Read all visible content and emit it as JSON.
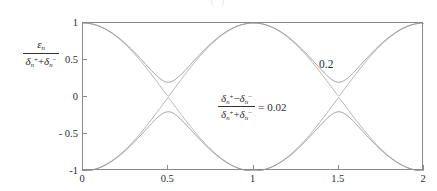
{
  "figure": {
    "caption_remnant": "( )",
    "y_axis_label": {
      "numerator_symbol": "ε",
      "numerator_sub": "n",
      "den_first_symbol": "δ",
      "den_first_sub": "n",
      "den_first_sup": "+",
      "den_plus": "+",
      "den_second_symbol": "δ",
      "den_second_sub": "n",
      "den_second_sup": "−"
    },
    "annotation_ratio": {
      "num_first_symbol": "δ",
      "num_first_sub": "n",
      "num_first_sup": "+",
      "num_minus": "−",
      "num_second_symbol": "δ",
      "num_second_sub": "n",
      "num_second_sup": "−",
      "den_first_symbol": "δ",
      "den_first_sub": "n",
      "den_first_sup": "+",
      "den_plus": "+",
      "den_second_symbol": "δ",
      "den_second_sub": "n",
      "den_second_sup": "−",
      "equals": "=",
      "value": "0.02"
    },
    "annotation_gap_label": "0.2",
    "colors": {
      "axis": "#8a8a8a",
      "curve_small_gap": "#9a9a9a",
      "curve_large_gap": "#8c8c8c",
      "text": "#2b2b2b"
    }
  },
  "chart_data": {
    "type": "line",
    "title": "",
    "xlabel": "",
    "ylabel": "ε_n / (δ_n^+ + δ_n^-)",
    "xlim": [
      0,
      2
    ],
    "ylim": [
      -1,
      1
    ],
    "xticks": [
      0,
      0.5,
      1,
      1.5,
      2
    ],
    "xticklabels": [
      "0",
      "0.5",
      "1",
      "1.5",
      "2"
    ],
    "yticks": [
      1,
      0.5,
      0,
      -0.5,
      -1
    ],
    "yticklabels": [
      "1",
      "0.5",
      "0",
      "- 0.5",
      "-1"
    ],
    "grid": false,
    "legend": null,
    "annotations": [
      {
        "text": "0.2",
        "x": 1.55,
        "y": 0.36
      },
      {
        "text": "(δ_n^+ − δ_n^-)/(δ_n^+ + δ_n^-) = 0.02",
        "x": 0.92,
        "y": 0.05
      }
    ],
    "series": [
      {
        "name": "gap 0.02 upper",
        "gap_half_width": 0.01,
        "x": [
          0,
          0.05,
          0.1,
          0.15,
          0.2,
          0.25,
          0.3,
          0.35,
          0.4,
          0.45,
          0.5,
          0.55,
          0.6,
          0.65,
          0.7,
          0.75,
          0.8,
          0.85,
          0.9,
          0.95,
          1,
          1.05,
          1.1,
          1.15,
          1.2,
          1.25,
          1.3,
          1.35,
          1.4,
          1.45,
          1.5,
          1.55,
          1.6,
          1.65,
          1.7,
          1.75,
          1.8,
          1.85,
          1.9,
          1.95,
          2
        ],
        "values": [
          1,
          0.988,
          0.951,
          0.891,
          0.809,
          0.707,
          0.588,
          0.454,
          0.309,
          0.157,
          0.01,
          0.157,
          0.309,
          0.454,
          0.588,
          0.707,
          0.809,
          0.891,
          0.951,
          0.988,
          1,
          0.988,
          0.951,
          0.891,
          0.809,
          0.707,
          0.588,
          0.454,
          0.309,
          0.157,
          0.01,
          0.157,
          0.309,
          0.454,
          0.588,
          0.707,
          0.809,
          0.891,
          0.951,
          0.988,
          1
        ]
      },
      {
        "name": "gap 0.02 lower",
        "gap_half_width": 0.01,
        "x": [
          0,
          0.05,
          0.1,
          0.15,
          0.2,
          0.25,
          0.3,
          0.35,
          0.4,
          0.45,
          0.5,
          0.55,
          0.6,
          0.65,
          0.7,
          0.75,
          0.8,
          0.85,
          0.9,
          0.95,
          1,
          1.05,
          1.1,
          1.15,
          1.2,
          1.25,
          1.3,
          1.35,
          1.4,
          1.45,
          1.5,
          1.55,
          1.6,
          1.65,
          1.7,
          1.75,
          1.8,
          1.85,
          1.9,
          1.95,
          2
        ],
        "values": [
          -1,
          -0.988,
          -0.951,
          -0.891,
          -0.809,
          -0.707,
          -0.588,
          -0.454,
          -0.309,
          -0.157,
          -0.01,
          -0.157,
          -0.309,
          -0.454,
          -0.588,
          -0.707,
          -0.809,
          -0.891,
          -0.951,
          -0.988,
          -1,
          -0.988,
          -0.951,
          -0.891,
          -0.809,
          -0.707,
          -0.588,
          -0.454,
          -0.309,
          -0.157,
          -0.01,
          -0.157,
          -0.309,
          -0.454,
          -0.588,
          -0.707,
          -0.809,
          -0.891,
          -0.951,
          -0.988,
          -1
        ]
      },
      {
        "name": "gap 0.2 upper",
        "gap_half_width": 0.2,
        "x": [
          0,
          0.05,
          0.1,
          0.15,
          0.2,
          0.25,
          0.3,
          0.35,
          0.4,
          0.45,
          0.5,
          0.55,
          0.6,
          0.65,
          0.7,
          0.75,
          0.8,
          0.85,
          0.9,
          0.95,
          1,
          1.05,
          1.1,
          1.15,
          1.2,
          1.25,
          1.3,
          1.35,
          1.4,
          1.45,
          1.5,
          1.55,
          1.6,
          1.65,
          1.7,
          1.75,
          1.8,
          1.85,
          1.9,
          1.95,
          2
        ],
        "values": [
          1,
          0.989,
          0.955,
          0.899,
          0.823,
          0.728,
          0.62,
          0.503,
          0.383,
          0.273,
          0.2,
          0.273,
          0.383,
          0.503,
          0.62,
          0.728,
          0.823,
          0.899,
          0.955,
          0.989,
          1,
          0.989,
          0.955,
          0.899,
          0.823,
          0.728,
          0.62,
          0.503,
          0.383,
          0.273,
          0.2,
          0.273,
          0.383,
          0.503,
          0.62,
          0.728,
          0.823,
          0.899,
          0.955,
          0.989,
          1
        ]
      },
      {
        "name": "gap 0.2 lower",
        "gap_half_width": 0.2,
        "x": [
          0,
          0.05,
          0.1,
          0.15,
          0.2,
          0.25,
          0.3,
          0.35,
          0.4,
          0.45,
          0.5,
          0.55,
          0.6,
          0.65,
          0.7,
          0.75,
          0.8,
          0.85,
          0.9,
          0.95,
          1,
          1.05,
          1.1,
          1.15,
          1.2,
          1.25,
          1.3,
          1.35,
          1.4,
          1.45,
          1.5,
          1.55,
          1.6,
          1.65,
          1.7,
          1.75,
          1.8,
          1.85,
          1.9,
          1.95,
          2
        ],
        "values": [
          -1,
          -0.989,
          -0.955,
          -0.899,
          -0.823,
          -0.728,
          -0.62,
          -0.503,
          -0.383,
          -0.273,
          -0.2,
          -0.273,
          -0.383,
          -0.503,
          -0.62,
          -0.728,
          -0.823,
          -0.899,
          -0.955,
          -0.989,
          -1,
          -0.989,
          -0.955,
          -0.899,
          -0.823,
          -0.728,
          -0.62,
          -0.503,
          -0.383,
          -0.273,
          -0.2,
          -0.273,
          -0.383,
          -0.503,
          -0.62,
          -0.728,
          -0.823,
          -0.899,
          -0.955,
          -0.989,
          -1
        ]
      }
    ]
  }
}
